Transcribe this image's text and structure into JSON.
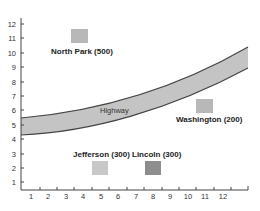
{
  "diagram": {
    "type": "map-grid",
    "x_axis": {
      "ticks": [
        "1",
        "2",
        "3",
        "4",
        "5",
        "6",
        "7",
        "8",
        "9",
        "10",
        "11",
        "12"
      ],
      "range": [
        0,
        13
      ]
    },
    "y_axis": {
      "ticks": [
        "1",
        "2",
        "3",
        "4",
        "5",
        "6",
        "7",
        "8",
        "9",
        "10",
        "11",
        "12"
      ],
      "range": [
        0.4,
        12.2
      ]
    },
    "highway": {
      "label": "Highway",
      "fill": "#c4c4c4",
      "edge": "#444444",
      "top_edge": [
        [
          0,
          5.5
        ],
        [
          13,
          10.4
        ]
      ],
      "bottom_edge": [
        [
          0,
          4.3
        ],
        [
          13,
          8.9
        ]
      ]
    },
    "locations": [
      {
        "name": "North Park (500)",
        "x": 4.5,
        "y": 11.0,
        "color": "#b8b8b8"
      },
      {
        "name": "Washington (200)",
        "x": 11.0,
        "y": 6.1,
        "color": "#b8b8b8"
      },
      {
        "name": "Jefferson (300)",
        "x": 4.5,
        "y": 1.8,
        "color": "#c8c8c8"
      },
      {
        "name": "Lincoln (300)",
        "x": 7.5,
        "y": 1.8,
        "color": "#8e8e8e"
      }
    ]
  },
  "labels": {
    "north_park": "North Park (500)",
    "washington": "Washington (200)",
    "jefferson": "Jefferson (300)",
    "lincoln": "Lincoln (300)",
    "highway": "Highway",
    "x1": "1",
    "x2": "2",
    "x3": "3",
    "x4": "4",
    "x5": "5",
    "x6": "6",
    "x7": "7",
    "x8": "8",
    "x9": "9",
    "x10": "10",
    "x11": "11",
    "x12": "12",
    "y1": "1",
    "y2": "2",
    "y3": "3",
    "y4": "4",
    "y5": "5",
    "y6": "6",
    "y7": "7",
    "y8": "8",
    "y9": "9",
    "y10": "10",
    "y11": "11",
    "y12": "12"
  }
}
